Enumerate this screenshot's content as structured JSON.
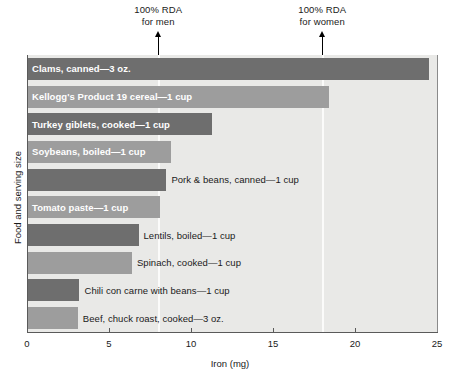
{
  "chart_data": {
    "type": "bar",
    "orientation": "horizontal",
    "title": "",
    "xlabel": "Iron (mg)",
    "ylabel": "Food and serving size",
    "xlim": [
      0,
      25
    ],
    "xticks": [
      0,
      5,
      10,
      15,
      20,
      25
    ],
    "xtick_labels": [
      "0",
      "5",
      "10",
      "15",
      "20",
      "25"
    ],
    "grid": false,
    "legend": "none",
    "categories": [
      "Clams, canned—3 oz.",
      "Kellogg's Product 19 cereal—1 cup",
      "Turkey giblets, cooked—1 cup",
      "Soybeans, boiled—1 cup",
      "Pork & beans, canned—1 cup",
      "Tomato paste—1 cup",
      "Lentils, boiled—1 cup",
      "Spinach, cooked—1 cup",
      "Chili con carne with beans—1 cup",
      "Beef, chuck roast, cooked—3 oz."
    ],
    "values": [
      24.5,
      18.4,
      11.3,
      8.8,
      8.5,
      8.1,
      6.8,
      6.4,
      3.2,
      3.1
    ],
    "bar_shades": [
      "dark",
      "light",
      "dark",
      "light",
      "dark",
      "light",
      "dark",
      "light",
      "dark",
      "light"
    ],
    "label_placement": [
      "inside",
      "inside",
      "inside",
      "inside",
      "outside",
      "inside",
      "outside",
      "outside",
      "outside",
      "outside"
    ],
    "annotations": [
      {
        "name": "rda-men",
        "line1": "100% RDA",
        "line2": "for men",
        "value": 8
      },
      {
        "name": "rda-women",
        "line1": "100% RDA",
        "line2": "for women",
        "value": 18
      }
    ]
  },
  "colors": {
    "bar_dark": "#6e6e6e",
    "bar_light": "#9d9d9d",
    "plot_background": "#e9e9e7",
    "axis": "#5a5a5a",
    "guide_line": "#fbfbfa",
    "label_inside": "#ffffff",
    "label_outside": "#1a1a1a"
  }
}
